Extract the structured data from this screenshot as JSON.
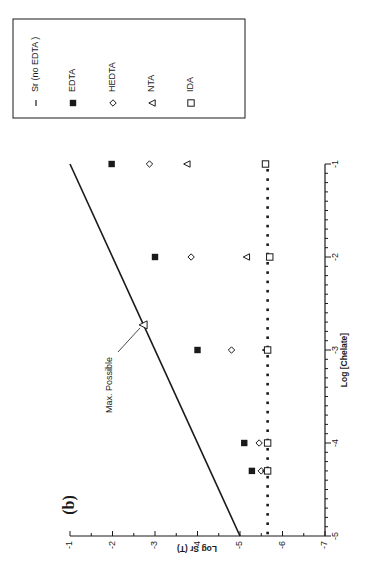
{
  "chart_data": {
    "type": "scatter",
    "panel_label": "(b)",
    "title": "",
    "xlabel": "Log [Chelate]",
    "ylabel": "Log Sr (T)",
    "xlim": [
      -5,
      -1
    ],
    "ylim": [
      -7,
      -1
    ],
    "x_ticks": [
      -5,
      -4,
      -3,
      -2,
      -1
    ],
    "x_tick_labels": [
      "-5",
      "-4",
      "-3",
      "-2",
      "-1"
    ],
    "y_ticks": [
      -7,
      -6,
      -5,
      -4,
      -3,
      -2,
      -1
    ],
    "y_tick_labels": [
      "-7",
      "-6",
      "-5",
      "-4",
      "-3",
      "-2",
      "-1"
    ],
    "orientation": "rotated 90 degrees counterclockwise on page",
    "grid": false,
    "legend_position": "upper-left box (rotated)",
    "series": [
      {
        "name": "Sr (no EDTA )",
        "marker": "dotted-line",
        "x": [
          -5,
          -1
        ],
        "y": [
          -5.65,
          -5.65
        ]
      },
      {
        "name": "EDTA",
        "marker": "filled-square",
        "x": [
          -4.3,
          -4,
          -3,
          -2,
          -1
        ],
        "y": [
          -5.28,
          -5.1,
          -4.0,
          -3.0,
          -1.98
        ]
      },
      {
        "name": "HEDTA",
        "marker": "open-diamond",
        "x": [
          -4.3,
          -4,
          -3,
          -2,
          -1
        ],
        "y": [
          -5.5,
          -5.45,
          -4.8,
          -3.85,
          -2.87
        ]
      },
      {
        "name": "NTA",
        "marker": "open-triangle",
        "x": [
          -4.3,
          -3,
          -2,
          -1
        ],
        "y": [
          -5.6,
          -5.6,
          -5.15,
          -3.75
        ]
      },
      {
        "name": "IDA",
        "marker": "open-square",
        "x": [
          -4.3,
          -4,
          -3,
          -2,
          -1
        ],
        "y": [
          -5.65,
          -5.65,
          -5.65,
          -5.7,
          -5.6
        ]
      }
    ],
    "reference_line": {
      "name": "Max. Possible",
      "x": [
        -5,
        -1
      ],
      "y": [
        -5,
        -1
      ]
    },
    "annotations": [
      {
        "text": "Max. Possible",
        "x": -2.73,
        "y": -2.72,
        "marker": "open-triangle"
      }
    ]
  },
  "legend": {
    "items": [
      {
        "label": "Sr (no EDTA )",
        "marker": "dash"
      },
      {
        "label": "EDTA",
        "marker": "filled-square"
      },
      {
        "label": "HEDTA",
        "marker": "open-diamond"
      },
      {
        "label": "NTA",
        "marker": "open-triangle"
      },
      {
        "label": "IDA",
        "marker": "open-square"
      }
    ]
  },
  "colors": {
    "ink": "#1a1a1a",
    "background": "#ffffff"
  }
}
